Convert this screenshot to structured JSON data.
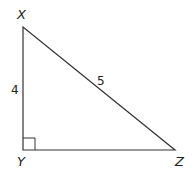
{
  "diagram": {
    "type": "right-triangle",
    "vertices": {
      "X": {
        "label": "X",
        "x": 23,
        "y": 27
      },
      "Y": {
        "label": "Y",
        "x": 23,
        "y": 150
      },
      "Z": {
        "label": "Z",
        "x": 175,
        "y": 150
      }
    },
    "sides": {
      "XY": {
        "label": "4"
      },
      "XZ": {
        "label": "5"
      },
      "YZ": {
        "label": ""
      }
    },
    "right_angle_at": "Y",
    "colors": {
      "stroke": "#333333",
      "text": "#222222",
      "background": "#ffffff"
    }
  }
}
